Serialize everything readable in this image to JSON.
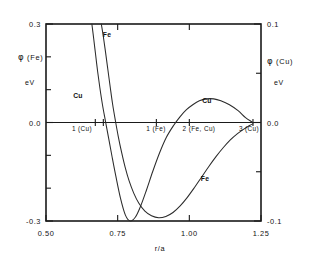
{
  "chart_data": {
    "type": "line",
    "title": "",
    "subtitle": "",
    "xlabel": "r/a",
    "xlim": [
      0.5,
      1.25
    ],
    "xticks": [
      0.5,
      0.75,
      1.0,
      1.25
    ],
    "xticklabels": [
      "0.50",
      "0.75",
      "1.00",
      "1.25"
    ],
    "grid": false,
    "legend_position": "inline-annotations",
    "left_axis": {
      "label_symbol": "φ",
      "label_species": "(Fe)",
      "label_text": "φ (Fe)",
      "unit": "eV",
      "ylim": [
        -0.3,
        0.3
      ],
      "yticks": [
        -0.3,
        -0.2,
        -0.1,
        0.0,
        0.1,
        0.2,
        0.3
      ],
      "yticklabels_shown": [
        "0.3",
        "0.0",
        "-0.3"
      ]
    },
    "right_axis": {
      "label_symbol": "φ",
      "label_species": "(Cu)",
      "label_text": "φ (Cu)",
      "unit": "eV",
      "ylim": [
        -0.1,
        0.1
      ],
      "yticks": [
        -0.1,
        -0.05,
        0.0,
        0.05,
        0.1
      ],
      "yticklabels_shown": [
        "0.1",
        "0.0",
        "-0.1"
      ]
    },
    "series": [
      {
        "name": "Fe",
        "axis": "left",
        "label": "Fe",
        "label_positions": [
          {
            "x": 0.735,
            "y": 0.258
          },
          {
            "x": 1.055,
            "y": -0.132
          }
        ],
        "x": [
          0.693,
          0.7,
          0.708,
          0.716,
          0.724,
          0.732,
          0.742,
          0.752,
          0.764,
          0.776,
          0.79,
          0.806,
          0.824,
          0.845,
          0.868,
          0.893,
          0.918,
          0.943,
          0.968,
          0.993,
          1.018,
          1.043,
          1.068,
          1.093,
          1.118,
          1.143,
          1.168,
          1.19,
          1.21,
          1.222
        ],
        "y": [
          0.3,
          0.262,
          0.212,
          0.16,
          0.108,
          0.058,
          0.006,
          -0.042,
          -0.092,
          -0.136,
          -0.178,
          -0.215,
          -0.246,
          -0.27,
          -0.284,
          -0.29,
          -0.286,
          -0.274,
          -0.254,
          -0.228,
          -0.198,
          -0.166,
          -0.134,
          -0.104,
          -0.077,
          -0.053,
          -0.034,
          -0.02,
          -0.009,
          -0.004
        ]
      },
      {
        "name": "Cu",
        "axis": "right",
        "label": "Cu",
        "label_positions": [
          {
            "x": 0.615,
            "y": 0.0285
          },
          {
            "x": 1.058,
            "y": 0.0275
          }
        ],
        "x": [
          0.66,
          0.666,
          0.673,
          0.68,
          0.688,
          0.697,
          0.707,
          0.718,
          0.73,
          0.744,
          0.76,
          0.777,
          0.794,
          0.812,
          0.83,
          0.85,
          0.872,
          0.896,
          0.92,
          0.945,
          0.968,
          0.99,
          1.012,
          1.035,
          1.06,
          1.085,
          1.11,
          1.14,
          1.17,
          1.196,
          1.216,
          1.222
        ],
        "y": [
          0.1,
          0.086,
          0.069,
          0.052,
          0.035,
          0.018,
          0.002,
          -0.015,
          -0.034,
          -0.055,
          -0.077,
          -0.094,
          -0.1,
          -0.096,
          -0.085,
          -0.069,
          -0.05,
          -0.031,
          -0.015,
          -0.003,
          0.006,
          0.013,
          0.018,
          0.022,
          0.024,
          0.024,
          0.022,
          0.018,
          0.012,
          0.005,
          0.001,
          0.0
        ]
      }
    ],
    "annotations": [
      {
        "name": "shell-1-cu",
        "text": "1 (Cu)",
        "x": 0.628,
        "y": 0.0
      },
      {
        "name": "shell-1-fe",
        "text": "1 (Fe)",
        "x": 0.885,
        "y": 0.0
      },
      {
        "name": "shell-2-fecu",
        "text": "2 (Fe, Cu)",
        "x": 1.0,
        "y": 0.0
      },
      {
        "name": "shell-3-cu",
        "text": "3 (Cu)",
        "x": 1.185,
        "y": 0.0
      }
    ],
    "zero_line_ticks": [
      0.672,
      0.7,
      0.885,
      1.0,
      1.222
    ]
  },
  "colors": {
    "axis": "#1a1a1a",
    "curve": "#2b2b2b",
    "background": "#ffffff",
    "text": "#111111"
  },
  "labels": {
    "left_axis_unit": "eV",
    "right_axis_unit": "eV",
    "left_top_tick": "0.3",
    "left_zero_tick": "0.0",
    "left_bottom_tick": "-0.3",
    "right_top_tick": "0.1",
    "right_zero_tick": "0.0",
    "right_bottom_tick": "-0.1",
    "x_tick_1": "0.50",
    "x_tick_2": "0.75",
    "x_tick_3": "1.00",
    "x_tick_4": "1.25",
    "x_axis_title": "r/a",
    "left_axis_title": "φ (Fe)",
    "right_axis_title": "φ (Cu)",
    "phi_symbol": "φ",
    "left_axis_species": "(Fe)",
    "right_axis_species": "(Cu)",
    "curve_fe_top": "Fe",
    "curve_fe_bottom": "Fe",
    "curve_cu_left": "Cu",
    "curve_cu_right": "Cu",
    "shell_1_cu": "1 (Cu)",
    "shell_1_fe": "1 (Fe)",
    "shell_2_fecu": "2 (Fe, Cu)",
    "shell_3_cu": "3 (Cu)"
  }
}
